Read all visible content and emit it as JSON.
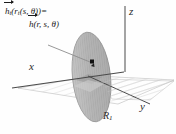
{
  "figure": {
    "type": "math-diagram-3d",
    "background_color": "#fefefe",
    "formula": {
      "line1_head": "h",
      "line1_sub": "t",
      "line1_tail": "(",
      "line1_inner_head": "r",
      "line1_inner_sub": "t",
      "line1_inner_tail": "(s, θ))=",
      "line2_head": "h",
      "line2_tail": "(r, s, θ)",
      "plain_line1": "h⃗ₜ(rₜ(s, θ))=",
      "plain_line2": "h⃗(r, s, θ)"
    },
    "axes": [
      {
        "name": "x",
        "label": "x"
      },
      {
        "name": "y",
        "label": "y"
      },
      {
        "name": "z",
        "label": "z"
      }
    ],
    "region": {
      "label_base": "R",
      "label_sub": "1",
      "plain": "R₁"
    },
    "marker": {
      "name": "point-marker",
      "shape": "square",
      "color": "#111111"
    },
    "colors": {
      "axis_line": "#4a4a4a",
      "disk_fill": "#b4b4b4",
      "disk_hatch": "#8f8f8f",
      "disk_edge": "#7d7d7d",
      "plane_fill": "#f2f2f2",
      "plane_hatch": "#c9c9c9",
      "plane_edge": "#a9a9a9",
      "leader_line": "#8c8c8c",
      "text": "#1c1c1c"
    }
  }
}
